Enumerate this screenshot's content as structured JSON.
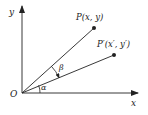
{
  "diagram": {
    "axes": {
      "x_label": "x",
      "y_label": "y",
      "origin_label": "O"
    },
    "points": [
      {
        "id": "P",
        "label": "P(x, y)"
      },
      {
        "id": "P-prime",
        "label": "P′(x′, y′)"
      }
    ],
    "angles": [
      {
        "id": "alpha",
        "label": "α"
      },
      {
        "id": "beta",
        "label": "β"
      }
    ],
    "colors": {
      "stroke": "#222222",
      "background": "#ffffff"
    }
  }
}
